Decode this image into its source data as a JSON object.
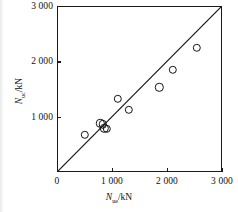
{
  "figure": {
    "background": "#ffffff",
    "axis_color": "#1a1a1a",
    "marker_color": "#141414"
  },
  "axes": {
    "x_title_symbol": "N",
    "x_title_sub": "ue",
    "x_title_unit": "/kN",
    "y_title_symbol": "N",
    "y_title_sub": "uc",
    "y_title_unit": "/kN",
    "x_ticks": [
      "0",
      "1 000",
      "2 000",
      "3 000"
    ],
    "y_ticks": [
      "1 000",
      "2 000",
      "3 000"
    ]
  },
  "chart_data": {
    "type": "scatter",
    "title": "",
    "xlabel": "N_ue/kN",
    "ylabel": "N_uc/kN",
    "xlim": [
      0,
      3000
    ],
    "ylim": [
      0,
      3000
    ],
    "xticks": [
      0,
      1000,
      2000,
      3000
    ],
    "yticks": [
      1000,
      2000,
      3000
    ],
    "xtick_labels": [
      "0",
      "1 000",
      "2 000",
      "3 000"
    ],
    "ytick_labels": [
      "1 000",
      "2 000",
      "3 000"
    ],
    "grid": false,
    "legend": null,
    "marker": "open-circle",
    "reference_line": {
      "label": "1:1 line",
      "from": [
        0,
        0
      ],
      "to": [
        3000,
        3000
      ]
    },
    "series": [
      {
        "name": "specimens",
        "points": [
          [
            510,
            670
          ],
          [
            790,
            880
          ],
          [
            830,
            860
          ],
          [
            860,
            790
          ],
          [
            900,
            780
          ],
          [
            1100,
            1320
          ],
          [
            1310,
            1120
          ],
          [
            1860,
            1530
          ],
          [
            2110,
            1850
          ],
          [
            2540,
            2240
          ]
        ]
      }
    ]
  }
}
